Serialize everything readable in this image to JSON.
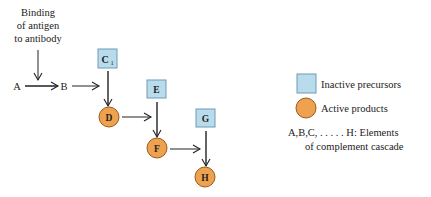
{
  "trigger": {
    "lines": [
      "Binding",
      "of antigen",
      "to antibody"
    ]
  },
  "nodes": {
    "A": {
      "label": "A",
      "kind": "plain"
    },
    "B": {
      "label": "B",
      "kind": "plain"
    },
    "C1": {
      "label": "C",
      "sub": "1",
      "kind": "inactive"
    },
    "D": {
      "label": "D",
      "kind": "active"
    },
    "E": {
      "label": "E",
      "kind": "inactive"
    },
    "F": {
      "label": "F",
      "kind": "active"
    },
    "G": {
      "label": "G",
      "kind": "inactive"
    },
    "H": {
      "label": "H",
      "kind": "active"
    }
  },
  "edges": [
    [
      "trigger",
      "A-B"
    ],
    [
      "A",
      "B"
    ],
    [
      "B",
      "D"
    ],
    [
      "C1",
      "D"
    ],
    [
      "D",
      "F"
    ],
    [
      "E",
      "F"
    ],
    [
      "F",
      "H"
    ],
    [
      "G",
      "H"
    ]
  ],
  "legend": {
    "inactive_label": "Inactive precursors",
    "active_label": "Active products",
    "note_lines": [
      "A,B,C, . . . . . H:  Elements",
      "of complement cascade"
    ]
  },
  "colors": {
    "inactive_fill": "#b9dcec",
    "inactive_stroke": "#6f9bb3",
    "active_fill": "#eea24e",
    "active_stroke": "#9a5a1e",
    "line": "#222222"
  }
}
